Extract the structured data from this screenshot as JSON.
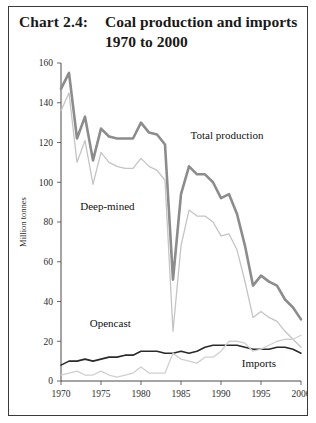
{
  "chart_card": {
    "border_color": "#3a3a3a",
    "background": "#ffffff"
  },
  "title": {
    "label": "Chart 2.4:",
    "line1": "Coal production and imports",
    "line2": "1970 to 2000"
  },
  "chart_data": {
    "type": "line",
    "title": "Coal production and imports 1970 to 2000",
    "xlabel": "",
    "ylabel": "Million tonnes",
    "xlim": [
      1970,
      2000
    ],
    "ylim": [
      0,
      160
    ],
    "ytick_step": 20,
    "xtick_step": 5,
    "grid": false,
    "legend": "inline-annotations",
    "yticks": [
      0,
      20,
      40,
      60,
      80,
      100,
      120,
      140,
      160
    ],
    "xticks": [
      1970,
      1975,
      1980,
      1985,
      1990,
      1995,
      2000
    ],
    "x": [
      1970,
      1971,
      1972,
      1973,
      1974,
      1975,
      1976,
      1977,
      1978,
      1979,
      1980,
      1981,
      1982,
      1983,
      1984,
      1985,
      1986,
      1987,
      1988,
      1989,
      1990,
      1991,
      1992,
      1993,
      1994,
      1995,
      1996,
      1997,
      1998,
      1999,
      2000
    ],
    "series": [
      {
        "name": "Total production",
        "color": "#8c8c8c",
        "width": 2.6,
        "values": [
          147,
          155,
          122,
          133,
          111,
          127,
          123,
          122,
          122,
          122,
          130,
          125,
          124,
          119,
          51,
          94,
          108,
          104,
          104,
          100,
          92,
          94,
          84,
          68,
          48,
          53,
          50,
          48,
          41,
          37,
          31
        ]
      },
      {
        "name": "Deep-mined",
        "color": "#c4c4c4",
        "width": 1.3,
        "values": [
          136,
          145,
          110,
          121,
          99,
          115,
          110,
          108,
          107,
          107,
          112,
          108,
          106,
          101,
          25,
          68,
          86,
          83,
          83,
          80,
          73,
          74,
          66,
          50,
          32,
          35,
          32,
          30,
          25,
          21,
          17
        ]
      },
      {
        "name": "Opencast",
        "color": "#2a2a2a",
        "width": 1.6,
        "values": [
          8,
          10,
          10,
          11,
          10,
          11,
          12,
          12,
          13,
          13,
          15,
          15,
          15,
          14,
          14,
          15,
          14,
          15,
          17,
          18,
          18,
          18,
          18,
          17,
          16,
          16,
          16,
          17,
          17,
          16,
          14
        ]
      },
      {
        "name": "Imports",
        "color": "#cfcfcf",
        "width": 1.3,
        "values": [
          3,
          4,
          5,
          3,
          3,
          5,
          3,
          2,
          3,
          4,
          7,
          4,
          4,
          4,
          14,
          11,
          10,
          9,
          12,
          12,
          15,
          20,
          20,
          19,
          15,
          16,
          18,
          20,
          21,
          21,
          23
        ]
      }
    ],
    "annotations": [
      {
        "text": "Total production",
        "x": 1986.2,
        "y": 122,
        "anchor": "start"
      },
      {
        "text": "Deep-mined",
        "x": 1972.4,
        "y": 86,
        "anchor": "start"
      },
      {
        "text": "Opencast",
        "x": 1973.6,
        "y": 27,
        "anchor": "start"
      },
      {
        "text": "Imports",
        "x": 1992.6,
        "y": 7,
        "anchor": "start"
      }
    ]
  }
}
